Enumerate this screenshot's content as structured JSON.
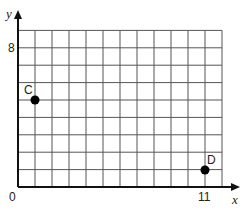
{
  "chart_data": {
    "type": "scatter",
    "title": "",
    "xlabel": "x",
    "ylabel": "y",
    "xlim": [
      0,
      12
    ],
    "ylim": [
      0,
      9
    ],
    "grid": true,
    "x_tick_labels": [
      "0",
      "11"
    ],
    "y_tick_labels": [
      "8"
    ],
    "points": [
      {
        "label": "C",
        "x": 1,
        "y": 5
      },
      {
        "label": "D",
        "x": 11,
        "y": 1
      }
    ]
  },
  "labels": {
    "origin": "0",
    "x_tick": "11",
    "y_tick": "8",
    "x_axis": "x",
    "y_axis": "y",
    "point_c": "C",
    "point_d": "D"
  },
  "colors": {
    "grid": "#555555",
    "axis": "#111111",
    "point": "#000000"
  }
}
